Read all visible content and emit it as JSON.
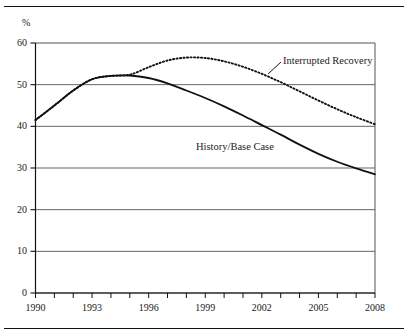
{
  "figure": {
    "top_caption": "",
    "axis_unit_label": "%"
  },
  "chart_data": {
    "type": "line",
    "title": "",
    "subtitle": "",
    "xlabel": "",
    "ylabel": "%",
    "xlim": [
      1990,
      2008
    ],
    "ylim": [
      0,
      60
    ],
    "grid": true,
    "grid_axis": "y",
    "legend_position": "inline-annotation",
    "y_ticks": [
      0,
      10,
      20,
      30,
      40,
      50,
      60
    ],
    "y_tick_labels": [
      "0",
      "10",
      "20",
      "30",
      "40",
      "50",
      "60"
    ],
    "x_ticks": [
      1990,
      1991,
      1992,
      1993,
      1994,
      1995,
      1996,
      1997,
      1998,
      1999,
      2000,
      2001,
      2002,
      2003,
      2004,
      2005,
      2006,
      2007,
      2008
    ],
    "x_tick_labels_shown": [
      "1990",
      "1993",
      "1996",
      "1999",
      "2002",
      "2005",
      "2008"
    ],
    "x": [
      1990,
      1991,
      1992,
      1993,
      1994,
      1995,
      1996,
      1997,
      1998,
      1999,
      2000,
      2001,
      2002,
      2003,
      2004,
      2005,
      2006,
      2007,
      2008
    ],
    "series": [
      {
        "name": "History/Base Case",
        "style": "solid",
        "color": "#111111",
        "values": [
          41.5,
          45.0,
          48.6,
          51.3,
          52.1,
          52.2,
          51.6,
          50.3,
          48.6,
          46.8,
          44.8,
          42.6,
          40.3,
          38.0,
          35.6,
          33.4,
          31.5,
          29.9,
          28.5
        ]
      },
      {
        "name": "Interrupted Recovery",
        "style": "dotted",
        "color": "#111111",
        "values": [
          41.5,
          45.0,
          48.6,
          51.3,
          52.1,
          52.4,
          54.2,
          55.8,
          56.5,
          56.4,
          55.6,
          54.3,
          52.6,
          50.6,
          48.4,
          46.2,
          44.1,
          42.2,
          40.5
        ]
      }
    ],
    "annotations": [
      {
        "text": "Interrupted Recovery",
        "series": "Interrupted Recovery"
      },
      {
        "text": "History/Base Case",
        "series": "History/Base Case"
      }
    ]
  }
}
